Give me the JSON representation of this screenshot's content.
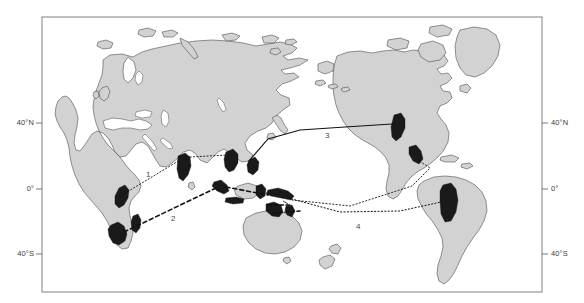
{
  "figure": {
    "kind": "world-map",
    "background_color": "#ffffff",
    "plot_border_color": "#808080",
    "land_fill": "#d2d2d2",
    "land_stroke": "#4d4d4d",
    "highlight_fill": "#1a1a1a",
    "route_color": "#111111",
    "label_color": "#3a3a3a"
  },
  "axes": {
    "left_ticks": [
      {
        "label": "40°N",
        "y": 123
      },
      {
        "label": "0°",
        "y": 189
      },
      {
        "label": "40°S",
        "y": 254
      }
    ],
    "right_ticks": [
      {
        "label": "40°N",
        "y": 123
      },
      {
        "label": "0°",
        "y": 189
      },
      {
        "label": "40°S",
        "y": 254
      }
    ]
  },
  "routes": [
    {
      "id": "route-1",
      "label": "1",
      "style": "dotted-fine",
      "label_x": 146,
      "label_y": 175,
      "from": "east-africa",
      "to": "south-india"
    },
    {
      "id": "route-2",
      "label": "2",
      "style": "dashed-coarse",
      "label_x": 171,
      "label_y": 219,
      "from": "southern-africa",
      "to": "indonesia"
    },
    {
      "id": "route-3",
      "label": "3",
      "style": "solid",
      "label_x": 325,
      "label_y": 136,
      "from": "east-asia",
      "to": "north-america-west-coast"
    },
    {
      "id": "route-4",
      "label": "4",
      "style": "dotted-fine",
      "label_x": 356,
      "label_y": 227,
      "from": "new-guinea",
      "to": "south-america-west-coast"
    }
  ],
  "highlight_regions": [
    {
      "name": "east-africa"
    },
    {
      "name": "southern-africa"
    },
    {
      "name": "madagascar"
    },
    {
      "name": "south-india"
    },
    {
      "name": "indochina"
    },
    {
      "name": "philippines"
    },
    {
      "name": "sumatra-java"
    },
    {
      "name": "sulawesi"
    },
    {
      "name": "new-guinea"
    },
    {
      "name": "north-australia"
    },
    {
      "name": "north-america-west-coast"
    },
    {
      "name": "mexico-west-coast"
    },
    {
      "name": "south-america-west-coast"
    }
  ]
}
